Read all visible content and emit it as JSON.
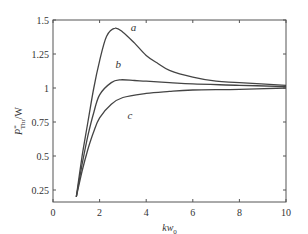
{
  "chart_data": {
    "type": "line",
    "title": "",
    "xlabel": "kw",
    "xlabel_sub": "0",
    "ylabel": "P",
    "ylabel_sup": "*",
    "ylabel_sub": "Thr",
    "ylabel_suffix": "/W",
    "xlim": [
      0,
      10
    ],
    "ylim": [
      0.16,
      1.5
    ],
    "xticks": [
      0,
      2,
      4,
      6,
      8,
      10
    ],
    "xtick_labels": [
      "0",
      "2",
      "4",
      "6",
      "8",
      "10"
    ],
    "yticks": [
      0.25,
      0.5,
      0.75,
      1,
      1.25,
      1.5
    ],
    "ytick_labels": [
      "0.25",
      "0.5",
      "0.75",
      "1",
      "1.25",
      "1.5"
    ],
    "grid": false,
    "legend": "inline curve labels",
    "series": [
      {
        "name": "a",
        "label_pos": [
          3.45,
          1.42
        ],
        "x": [
          1,
          1.25,
          1.5,
          1.75,
          2,
          2.3,
          2.66,
          3,
          3.5,
          4,
          4.5,
          5,
          6,
          7,
          8,
          10
        ],
        "y": [
          0.2,
          0.5,
          0.75,
          1.0,
          1.2,
          1.38,
          1.44,
          1.41,
          1.33,
          1.24,
          1.18,
          1.13,
          1.08,
          1.05,
          1.04,
          1.02
        ]
      },
      {
        "name": "b",
        "label_pos": [
          2.8,
          1.15
        ],
        "x": [
          1,
          1.25,
          1.5,
          1.75,
          2,
          2.5,
          2.9,
          3.5,
          4,
          5,
          6,
          8,
          10
        ],
        "y": [
          0.2,
          0.44,
          0.65,
          0.82,
          0.95,
          1.04,
          1.06,
          1.055,
          1.05,
          1.04,
          1.03,
          1.02,
          1.01
        ]
      },
      {
        "name": "c",
        "label_pos": [
          3.3,
          0.77
        ],
        "x": [
          1,
          1.25,
          1.5,
          1.75,
          2,
          2.5,
          3,
          4,
          5,
          6,
          8,
          10
        ],
        "y": [
          0.2,
          0.39,
          0.55,
          0.68,
          0.78,
          0.88,
          0.93,
          0.96,
          0.975,
          0.985,
          0.99,
          1.0
        ]
      }
    ]
  }
}
